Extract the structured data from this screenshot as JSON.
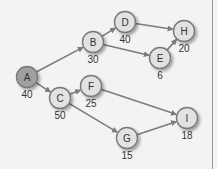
{
  "diagram": {
    "type": "network-graph",
    "colors": {
      "background": "#f3f3f3",
      "node_fill": "#e2e2e2",
      "start_node_fill": "#a0a0a0",
      "node_stroke": "#7a7a7a",
      "edge": "#7c7c7c",
      "label": "#333333"
    },
    "nodes": [
      {
        "id": "A",
        "label": "A",
        "value": "40",
        "x": 27,
        "y": 77,
        "start": true
      },
      {
        "id": "B",
        "label": "B",
        "value": "30",
        "x": 93,
        "y": 42
      },
      {
        "id": "C",
        "label": "C",
        "value": "50",
        "x": 60,
        "y": 98
      },
      {
        "id": "D",
        "label": "D",
        "value": "40",
        "x": 125,
        "y": 22
      },
      {
        "id": "E",
        "label": "E",
        "value": "6",
        "x": 160,
        "y": 58
      },
      {
        "id": "F",
        "label": "F",
        "value": "25",
        "x": 91,
        "y": 86
      },
      {
        "id": "G",
        "label": "G",
        "value": "15",
        "x": 127,
        "y": 138
      },
      {
        "id": "H",
        "label": "H",
        "value": "20",
        "x": 184,
        "y": 31
      },
      {
        "id": "I",
        "label": "I",
        "value": "18",
        "x": 187,
        "y": 118
      }
    ],
    "edges": [
      {
        "from": "A",
        "to": "B"
      },
      {
        "from": "A",
        "to": "C"
      },
      {
        "from": "B",
        "to": "D"
      },
      {
        "from": "B",
        "to": "E"
      },
      {
        "from": "D",
        "to": "H"
      },
      {
        "from": "E",
        "to": "H"
      },
      {
        "from": "C",
        "to": "F"
      },
      {
        "from": "C",
        "to": "G"
      },
      {
        "from": "F",
        "to": "I"
      },
      {
        "from": "G",
        "to": "I"
      }
    ]
  }
}
